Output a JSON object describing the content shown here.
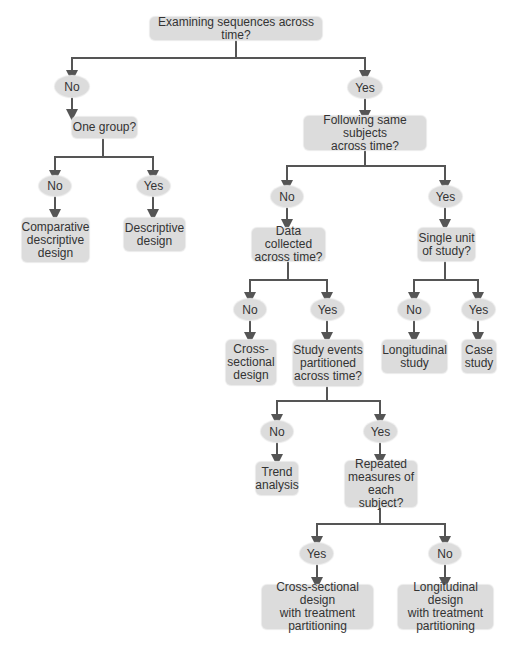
{
  "diagram": {
    "root": "Examining sequences across time?",
    "answers": {
      "no": "No",
      "yes": "Yes"
    },
    "nodes": {
      "one_group": "One group?",
      "comparative_descriptive": "Comparative\ndescriptive\ndesign",
      "descriptive": "Descriptive\ndesign",
      "following_same": "Following same subjects\nacross time?",
      "data_collected": "Data collected\nacross time?",
      "single_unit": "Single unit\nof study?",
      "cross_sectional": "Cross-\nsectional\ndesign",
      "study_events": "Study events\npartitioned\nacross time?",
      "longitudinal_study": "Longitudinal\nstudy",
      "case_study": "Case\nstudy",
      "trend_analysis": "Trend\nanalysis",
      "repeated_measures": "Repeated\nmeasures of\neach subject?",
      "cross_sectional_treatment": "Cross-sectional design\nwith treatment\npartitioning",
      "longitudinal_treatment": "Longitudinal design\nwith treatment\npartitioning"
    },
    "colors": {
      "node_fill": "#dcdcdc",
      "line": "#555555",
      "text": "#333333"
    }
  }
}
